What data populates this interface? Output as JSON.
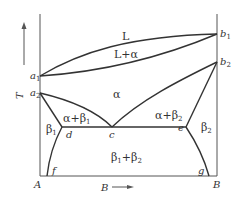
{
  "diagram": {
    "type": "binary phase diagram",
    "axes": {
      "y_label": "T",
      "x_label": "B",
      "left_component": "A",
      "right_component": "B"
    },
    "points": {
      "a1": {
        "base": "a",
        "sub": "1"
      },
      "a2": {
        "base": "a",
        "sub": "2"
      },
      "b1": {
        "base": "b",
        "sub": "1"
      },
      "b2": {
        "base": "b",
        "sub": "2"
      },
      "c": "c",
      "d": "d",
      "e": "e",
      "f": "f",
      "g": "g"
    },
    "regions": {
      "liquid": "L",
      "liquid_alpha": "L+α",
      "alpha": "α",
      "alpha_beta1": {
        "base": "α+β",
        "sub": "1"
      },
      "alpha_beta2": {
        "base": "α+β",
        "sub": "2"
      },
      "beta1": {
        "base": "β",
        "sub": "1"
      },
      "beta2": {
        "base": "β",
        "sub": "2"
      },
      "beta1_beta2": {
        "part1": "β",
        "sub1": "1",
        "part2": "+β",
        "sub2": "2"
      }
    },
    "colors": {
      "line": "#333333",
      "axis": "#555555",
      "background": "#ffffff"
    }
  }
}
